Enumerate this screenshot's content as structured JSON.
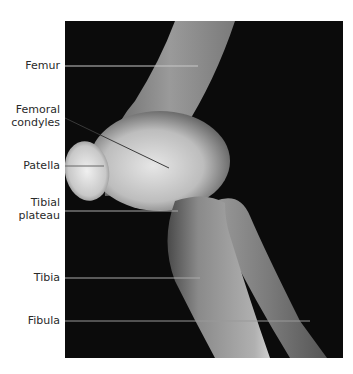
{
  "figure": {
    "type": "lateral knee radiograph",
    "background": "#0b0b0b"
  },
  "labels": [
    {
      "id": "femur",
      "text": "Femur",
      "lines": [
        "Femur"
      ]
    },
    {
      "id": "femoral-condyles",
      "text": "Femoral condyles",
      "lines": [
        "Femoral",
        "condyles"
      ]
    },
    {
      "id": "patella",
      "text": "Patella",
      "lines": [
        "Patella"
      ]
    },
    {
      "id": "tibial-plateau",
      "text": "Tibial plateau",
      "lines": [
        "Tibial",
        "plateau"
      ]
    },
    {
      "id": "tibia",
      "text": "Tibia",
      "lines": [
        "Tibia"
      ]
    },
    {
      "id": "fibula",
      "text": "Fibula",
      "lines": [
        "Fibula"
      ]
    }
  ]
}
